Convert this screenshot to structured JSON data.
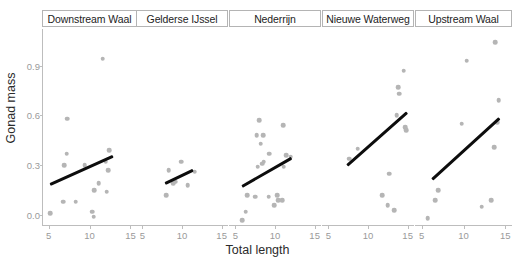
{
  "chart_data": {
    "type": "scatter",
    "title": "",
    "xlabel": "Total length",
    "ylabel": "Gonad mass",
    "xlim": [
      4.2,
      15.8
    ],
    "ylim": [
      0.0,
      1.18
    ],
    "xticks": [
      5,
      10,
      15
    ],
    "xtick_labels": [
      "5",
      "10",
      "15"
    ],
    "yticks": [
      0.0,
      0.3,
      0.6,
      0.9
    ],
    "ytick_labels": [
      "0.0",
      "0.3",
      "0.6",
      "0.9"
    ],
    "grid": false,
    "legend": "none",
    "facet_variable": "river",
    "point_color": "#b5b5b5",
    "line_color": "#0d0d0d",
    "facets": [
      {
        "label": "Downstream Waal",
        "points": [
          {
            "x": 11.6,
            "y": 1.0
          },
          {
            "x": 7.3,
            "y": 0.64
          },
          {
            "x": 12.4,
            "y": 0.45
          },
          {
            "x": 7.2,
            "y": 0.43
          },
          {
            "x": 12.0,
            "y": 0.38
          },
          {
            "x": 6.9,
            "y": 0.36
          },
          {
            "x": 9.4,
            "y": 0.36
          },
          {
            "x": 12.3,
            "y": 0.33
          },
          {
            "x": 11.1,
            "y": 0.25
          },
          {
            "x": 10.6,
            "y": 0.21
          },
          {
            "x": 12.1,
            "y": 0.2
          },
          {
            "x": 6.8,
            "y": 0.14
          },
          {
            "x": 8.3,
            "y": 0.14
          },
          {
            "x": 10.3,
            "y": 0.08
          },
          {
            "x": 5.2,
            "y": 0.07
          },
          {
            "x": 10.5,
            "y": 0.05
          }
        ],
        "fit": {
          "x0": 5.2,
          "y0": 0.25,
          "x1": 12.9,
          "y1": 0.42
        }
      },
      {
        "label": "Gelderse IJssel",
        "points": [
          {
            "x": 9.9,
            "y": 0.38
          },
          {
            "x": 8.3,
            "y": 0.33
          },
          {
            "x": 11.6,
            "y": 0.32
          },
          {
            "x": 9.2,
            "y": 0.26
          },
          {
            "x": 8.9,
            "y": 0.25
          },
          {
            "x": 10.7,
            "y": 0.24
          },
          {
            "x": 8.0,
            "y": 0.18
          }
        ],
        "fit": {
          "x0": 7.9,
          "y0": 0.26,
          "x1": 11.4,
          "y1": 0.34
        }
      },
      {
        "label": "Nederrijn",
        "points": [
          {
            "x": 8.0,
            "y": 0.63
          },
          {
            "x": 11.0,
            "y": 0.6
          },
          {
            "x": 7.7,
            "y": 0.54
          },
          {
            "x": 8.5,
            "y": 0.54
          },
          {
            "x": 8.2,
            "y": 0.49
          },
          {
            "x": 9.3,
            "y": 0.43
          },
          {
            "x": 11.4,
            "y": 0.42
          },
          {
            "x": 12.0,
            "y": 0.41
          },
          {
            "x": 8.6,
            "y": 0.38
          },
          {
            "x": 8.4,
            "y": 0.37
          },
          {
            "x": 7.8,
            "y": 0.35
          },
          {
            "x": 11.1,
            "y": 0.35
          },
          {
            "x": 6.5,
            "y": 0.18
          },
          {
            "x": 7.5,
            "y": 0.17
          },
          {
            "x": 9.2,
            "y": 0.17
          },
          {
            "x": 10.3,
            "y": 0.18
          },
          {
            "x": 10.4,
            "y": 0.15
          },
          {
            "x": 10.9,
            "y": 0.15
          },
          {
            "x": 9.9,
            "y": 0.12
          },
          {
            "x": 6.3,
            "y": 0.08
          },
          {
            "x": 5.9,
            "y": 0.03
          }
        ],
        "fit": {
          "x0": 5.9,
          "y0": 0.24,
          "x1": 12.1,
          "y1": 0.41
        }
      },
      {
        "label": "Nieuwe Waterweg",
        "points": [
          {
            "x": 14.5,
            "y": 0.93
          },
          {
            "x": 13.8,
            "y": 0.83
          },
          {
            "x": 13.9,
            "y": 0.79
          },
          {
            "x": 13.6,
            "y": 0.66
          },
          {
            "x": 14.7,
            "y": 0.59
          },
          {
            "x": 14.8,
            "y": 0.57
          },
          {
            "x": 8.7,
            "y": 0.46
          },
          {
            "x": 7.6,
            "y": 0.4
          },
          {
            "x": 12.7,
            "y": 0.31
          },
          {
            "x": 11.8,
            "y": 0.18
          },
          {
            "x": 12.5,
            "y": 0.12
          },
          {
            "x": 13.3,
            "y": 0.09
          }
        ],
        "fit": {
          "x0": 7.3,
          "y0": 0.37,
          "x1": 14.9,
          "y1": 0.69
        }
      },
      {
        "label": "Upstream Waal",
        "points": [
          {
            "x": 13.8,
            "y": 1.1
          },
          {
            "x": 10.4,
            "y": 0.99
          },
          {
            "x": 14.2,
            "y": 0.75
          },
          {
            "x": 14.0,
            "y": 0.62
          },
          {
            "x": 9.8,
            "y": 0.61
          },
          {
            "x": 13.7,
            "y": 0.47
          },
          {
            "x": 7.0,
            "y": 0.21
          },
          {
            "x": 6.6,
            "y": 0.15
          },
          {
            "x": 13.3,
            "y": 0.15
          },
          {
            "x": 12.2,
            "y": 0.11
          },
          {
            "x": 5.7,
            "y": 0.04
          }
        ],
        "fit": {
          "x0": 6.2,
          "y0": 0.28,
          "x1": 14.3,
          "y1": 0.65
        }
      }
    ]
  }
}
